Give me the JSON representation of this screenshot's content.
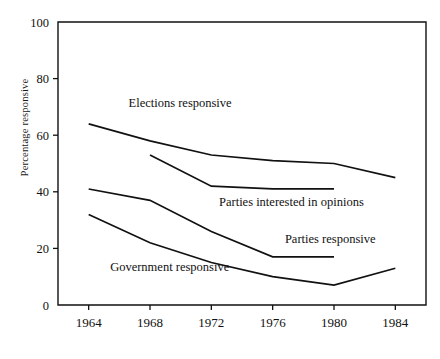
{
  "chart_data": {
    "type": "line",
    "title": "",
    "xlabel": "",
    "ylabel": "Percentage responsive",
    "x": [
      1964,
      1968,
      1972,
      1976,
      1980,
      1984
    ],
    "xticklabels": [
      "1964",
      "1968",
      "1972",
      "1976",
      "1980",
      "1984"
    ],
    "yticklabels": [
      "0",
      "20",
      "40",
      "60",
      "80",
      "100"
    ],
    "yticks": [
      0,
      20,
      40,
      60,
      80,
      100
    ],
    "xlim": [
      1962,
      1986
    ],
    "ylim": [
      0,
      100
    ],
    "grid": false,
    "legend": "inline-labels",
    "line_color": "#111111",
    "background": "#ffffff",
    "series": [
      {
        "name": "Elections responsive",
        "label": "Elections responsive",
        "x": [
          1964,
          1968,
          1972,
          1976,
          1980,
          1984
        ],
        "values": [
          64,
          58,
          53,
          51,
          50,
          45
        ]
      },
      {
        "name": "Parties interested in opinions",
        "label": "Parties interested in opinions",
        "x": [
          1968,
          1972,
          1976,
          1980
        ],
        "values": [
          53,
          42,
          41,
          41
        ]
      },
      {
        "name": "Parties responsive",
        "label": "Parties responsive",
        "x": [
          1964,
          1968,
          1972,
          1976,
          1980
        ],
        "values": [
          41,
          37,
          26,
          17,
          17
        ]
      },
      {
        "name": "Government responsive",
        "label": "Government responsive",
        "x": [
          1964,
          1968,
          1972,
          1976,
          1980,
          1984
        ],
        "values": [
          32,
          22,
          15,
          10,
          7,
          13
        ]
      }
    ],
    "annotations": [
      {
        "text": "Elections responsive",
        "x": 1966.6,
        "y": 70
      },
      {
        "text": "Parties interested in opinions",
        "x": 1972.5,
        "y": 35
      },
      {
        "text": "Parties responsive",
        "x": 1976.8,
        "y": 22
      },
      {
        "text": "Government responsive",
        "x": 1965.4,
        "y": 12
      }
    ]
  }
}
